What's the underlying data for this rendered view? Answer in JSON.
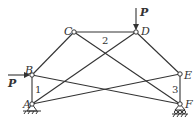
{
  "diagram": {
    "type": "truss",
    "nodes": [
      {
        "id": "A",
        "label": "A",
        "x": 32,
        "y": 104
      },
      {
        "id": "B",
        "label": "B",
        "x": 32,
        "y": 75
      },
      {
        "id": "C",
        "label": "C",
        "x": 74,
        "y": 32
      },
      {
        "id": "D",
        "label": "D",
        "x": 136,
        "y": 32
      },
      {
        "id": "E",
        "label": "E",
        "x": 180,
        "y": 74
      },
      {
        "id": "F",
        "label": "F",
        "x": 180,
        "y": 104
      }
    ],
    "members": [
      [
        "A",
        "B"
      ],
      [
        "B",
        "C"
      ],
      [
        "C",
        "D"
      ],
      [
        "D",
        "E"
      ],
      [
        "E",
        "F"
      ],
      [
        "C",
        "F"
      ],
      [
        "A",
        "D"
      ],
      [
        "B",
        "F"
      ],
      [
        "A",
        "E"
      ]
    ],
    "member_labels": [
      {
        "text": "1",
        "member": "AB"
      },
      {
        "text": "2",
        "member": "CD"
      },
      {
        "text": "3",
        "member": "EF"
      }
    ],
    "loads": [
      {
        "label": "P",
        "at": "B",
        "direction": "right"
      },
      {
        "label": "P",
        "at": "D",
        "direction": "down"
      }
    ],
    "supports": [
      {
        "at": "A",
        "type": "pin"
      },
      {
        "at": "F",
        "type": "roller"
      }
    ]
  }
}
